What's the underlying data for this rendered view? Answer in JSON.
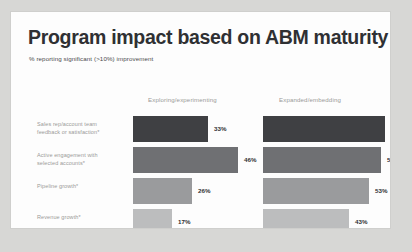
{
  "card": {
    "title": "Program impact based on ABM maturity",
    "subtitle": "% reporting significant (>10%) improvement"
  },
  "chart_data": {
    "type": "bar",
    "orientation": "horizontal",
    "title": "Program impact based on ABM maturity",
    "subtitle": "% reporting significant (>10%) improvement",
    "xlabel": "",
    "ylabel": "",
    "xlim": [
      0,
      100
    ],
    "grid": false,
    "legend": "none",
    "value_suffix": "%",
    "categories": [
      "Sales rep/account team feedback or satisfaction*",
      "Active engagement with selected accounts*",
      "Pipeline growth*",
      "Revenue growth*"
    ],
    "series": [
      {
        "name": "Exploring/experimenting",
        "values": [
          33,
          46,
          26,
          17
        ],
        "labels": [
          "33%",
          "46%",
          "26%",
          "17%"
        ]
      },
      {
        "name": "Expanded/embedding",
        "values": [
          61,
          59,
          53,
          43
        ],
        "labels": [
          "61%",
          "59%",
          "53%",
          "43%"
        ]
      }
    ],
    "bar_colors": [
      "#3f4043",
      "#6f7073",
      "#9a9b9d",
      "#bcbdbe"
    ]
  }
}
